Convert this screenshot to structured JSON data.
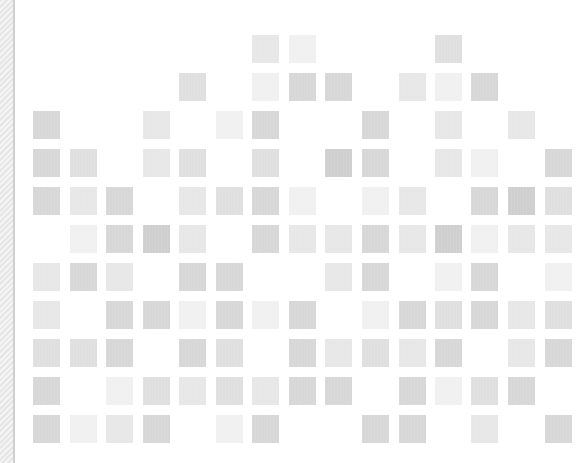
{
  "layout": {
    "col_x": [
      33,
      70,
      106,
      143,
      179,
      216,
      252,
      289,
      325,
      362,
      399,
      435,
      471,
      508,
      545
    ],
    "row_y": [
      35,
      73,
      111,
      149,
      187,
      225,
      263,
      301,
      339,
      377,
      415
    ]
  },
  "colors": {
    "background": "#ffffff",
    "strip_light": "#f4f4f4",
    "strip_dark": "#e6e6e6",
    "strip_edge": "#cfcfcf",
    "levels": {
      "1": "#f0f0f0",
      "2": "#e7e7e7",
      "3": "#dfdfdf",
      "4": "#d7d7d7",
      "5": "#cfcfcf"
    }
  },
  "grid": {
    "rows": [
      {
        "row": 0,
        "tiles": [
          {
            "col": 6,
            "level": 2
          },
          {
            "col": 7,
            "level": 1
          },
          {
            "col": 11,
            "level": 3
          }
        ]
      },
      {
        "row": 1,
        "tiles": [
          {
            "col": 4,
            "level": 3
          },
          {
            "col": 6,
            "level": 1
          },
          {
            "col": 7,
            "level": 4
          },
          {
            "col": 8,
            "level": 4
          },
          {
            "col": 10,
            "level": 2
          },
          {
            "col": 11,
            "level": 1
          },
          {
            "col": 12,
            "level": 4
          }
        ]
      },
      {
        "row": 2,
        "tiles": [
          {
            "col": 0,
            "level": 4
          },
          {
            "col": 3,
            "level": 2
          },
          {
            "col": 5,
            "level": 1
          },
          {
            "col": 6,
            "level": 4
          },
          {
            "col": 9,
            "level": 4
          },
          {
            "col": 11,
            "level": 2
          },
          {
            "col": 13,
            "level": 2
          }
        ]
      },
      {
        "row": 3,
        "tiles": [
          {
            "col": 0,
            "level": 4
          },
          {
            "col": 1,
            "level": 3
          },
          {
            "col": 3,
            "level": 2
          },
          {
            "col": 4,
            "level": 3
          },
          {
            "col": 6,
            "level": 3
          },
          {
            "col": 8,
            "level": 5
          },
          {
            "col": 9,
            "level": 4
          },
          {
            "col": 11,
            "level": 2
          },
          {
            "col": 12,
            "level": 1
          },
          {
            "col": 14,
            "level": 4
          }
        ]
      },
      {
        "row": 4,
        "tiles": [
          {
            "col": 0,
            "level": 4
          },
          {
            "col": 1,
            "level": 2
          },
          {
            "col": 2,
            "level": 4
          },
          {
            "col": 4,
            "level": 2
          },
          {
            "col": 5,
            "level": 3
          },
          {
            "col": 6,
            "level": 4
          },
          {
            "col": 7,
            "level": 1
          },
          {
            "col": 9,
            "level": 1
          },
          {
            "col": 10,
            "level": 2
          },
          {
            "col": 12,
            "level": 4
          },
          {
            "col": 13,
            "level": 5
          },
          {
            "col": 14,
            "level": 3
          }
        ]
      },
      {
        "row": 5,
        "tiles": [
          {
            "col": 1,
            "level": 1
          },
          {
            "col": 2,
            "level": 4
          },
          {
            "col": 3,
            "level": 5
          },
          {
            "col": 4,
            "level": 2
          },
          {
            "col": 6,
            "level": 4
          },
          {
            "col": 7,
            "level": 2
          },
          {
            "col": 8,
            "level": 2
          },
          {
            "col": 9,
            "level": 4
          },
          {
            "col": 10,
            "level": 2
          },
          {
            "col": 11,
            "level": 5
          },
          {
            "col": 12,
            "level": 1
          },
          {
            "col": 13,
            "level": 2
          },
          {
            "col": 14,
            "level": 2
          }
        ]
      },
      {
        "row": 6,
        "tiles": [
          {
            "col": 0,
            "level": 2
          },
          {
            "col": 1,
            "level": 4
          },
          {
            "col": 2,
            "level": 2
          },
          {
            "col": 4,
            "level": 4
          },
          {
            "col": 5,
            "level": 4
          },
          {
            "col": 8,
            "level": 2
          },
          {
            "col": 9,
            "level": 4
          },
          {
            "col": 11,
            "level": 1
          },
          {
            "col": 12,
            "level": 4
          },
          {
            "col": 14,
            "level": 1
          }
        ]
      },
      {
        "row": 7,
        "tiles": [
          {
            "col": 0,
            "level": 2
          },
          {
            "col": 2,
            "level": 4
          },
          {
            "col": 3,
            "level": 4
          },
          {
            "col": 4,
            "level": 1
          },
          {
            "col": 5,
            "level": 4
          },
          {
            "col": 6,
            "level": 1
          },
          {
            "col": 7,
            "level": 4
          },
          {
            "col": 9,
            "level": 1
          },
          {
            "col": 10,
            "level": 4
          },
          {
            "col": 11,
            "level": 3
          },
          {
            "col": 12,
            "level": 4
          },
          {
            "col": 13,
            "level": 2
          },
          {
            "col": 14,
            "level": 3
          }
        ]
      },
      {
        "row": 8,
        "tiles": [
          {
            "col": 0,
            "level": 3
          },
          {
            "col": 1,
            "level": 3
          },
          {
            "col": 2,
            "level": 4
          },
          {
            "col": 4,
            "level": 4
          },
          {
            "col": 5,
            "level": 3
          },
          {
            "col": 7,
            "level": 4
          },
          {
            "col": 8,
            "level": 2
          },
          {
            "col": 9,
            "level": 3
          },
          {
            "col": 10,
            "level": 2
          },
          {
            "col": 11,
            "level": 4
          },
          {
            "col": 13,
            "level": 2
          },
          {
            "col": 14,
            "level": 4
          }
        ]
      },
      {
        "row": 9,
        "tiles": [
          {
            "col": 0,
            "level": 4
          },
          {
            "col": 2,
            "level": 1
          },
          {
            "col": 3,
            "level": 3
          },
          {
            "col": 4,
            "level": 2
          },
          {
            "col": 5,
            "level": 3
          },
          {
            "col": 6,
            "level": 2
          },
          {
            "col": 7,
            "level": 4
          },
          {
            "col": 8,
            "level": 4
          },
          {
            "col": 10,
            "level": 4
          },
          {
            "col": 11,
            "level": 1
          },
          {
            "col": 12,
            "level": 3
          },
          {
            "col": 13,
            "level": 4
          }
        ]
      },
      {
        "row": 10,
        "tiles": [
          {
            "col": 0,
            "level": 4
          },
          {
            "col": 1,
            "level": 1
          },
          {
            "col": 2,
            "level": 2
          },
          {
            "col": 3,
            "level": 4
          },
          {
            "col": 5,
            "level": 1
          },
          {
            "col": 6,
            "level": 4
          },
          {
            "col": 9,
            "level": 4
          },
          {
            "col": 10,
            "level": 4
          },
          {
            "col": 12,
            "level": 2
          },
          {
            "col": 14,
            "level": 4
          }
        ]
      }
    ]
  }
}
